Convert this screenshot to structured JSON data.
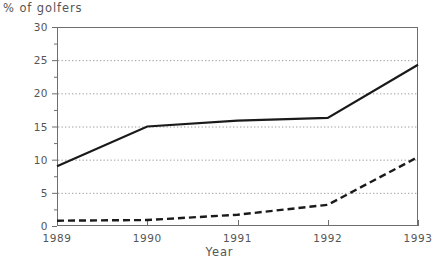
{
  "chart_data": {
    "type": "line",
    "title": "",
    "ylabel": "% of golfers",
    "xlabel": "Year",
    "categories": [
      "1989",
      "1990",
      "1991",
      "1992",
      "1993"
    ],
    "x": [
      1989,
      1990,
      1991,
      1992,
      1993
    ],
    "xlim": [
      1989,
      1993
    ],
    "ylim": [
      0,
      30
    ],
    "y_ticks": [
      0,
      5,
      10,
      15,
      20,
      25,
      30
    ],
    "y_minor_ticks": [
      2.5,
      7.5,
      12.5,
      17.5,
      22.5,
      27.5
    ],
    "y_tick_labels": [
      "0",
      "5",
      "10",
      "15",
      "20",
      "25",
      "30"
    ],
    "x_ticks": [
      1989,
      1990,
      1991,
      1992,
      1993
    ],
    "x_tick_labels": [
      "1989",
      "1990",
      "1991",
      "1992",
      "1993"
    ],
    "grid": true,
    "grid_style": "dotted-horizontal",
    "legend": "none",
    "legend_position": "none",
    "series": [
      {
        "name": "series-solid",
        "style": "solid",
        "color": "#1a1a1a",
        "values": [
          9.0,
          15.0,
          15.9,
          16.3,
          24.3
        ]
      },
      {
        "name": "series-dashed",
        "style": "dashed",
        "color": "#1a1a1a",
        "values": [
          0.8,
          0.9,
          1.7,
          3.2,
          10.4
        ]
      }
    ]
  },
  "colors": {
    "axis": "#6e6e6e",
    "grid": "#9a9a9a",
    "line": "#1a1a1a",
    "text": "#555555",
    "background": "#ffffff"
  }
}
